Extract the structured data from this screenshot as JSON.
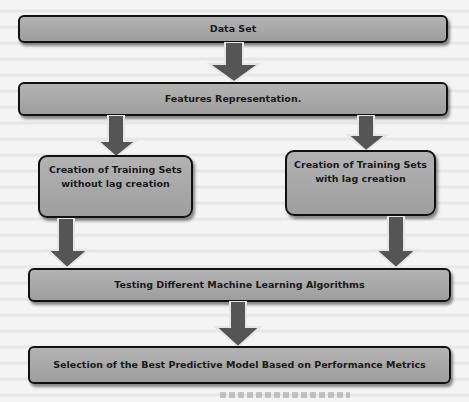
{
  "diagram": {
    "type": "flowchart",
    "colors": {
      "box_fill": "#a8a8a8",
      "box_border": "#111111",
      "arrow_fill": "#555555",
      "arrow_outline": "#e8e8e8",
      "background": "#f4f4f4"
    },
    "nodes": [
      {
        "id": "data_set",
        "label": "Data Set"
      },
      {
        "id": "features",
        "label": "Features Representation."
      },
      {
        "id": "train_no_lag",
        "label_line1": "Creation of Training Sets",
        "label_line2": "without lag creation"
      },
      {
        "id": "train_lag",
        "label_line1": "Creation of Training Sets",
        "label_line2": "with lag creation"
      },
      {
        "id": "testing",
        "label": "Testing Different Machine Learning Algorithms"
      },
      {
        "id": "selection",
        "label": "Selection of the Best Predictive Model Based on Performance Metrics"
      }
    ],
    "edges": [
      {
        "from": "data_set",
        "to": "features"
      },
      {
        "from": "features",
        "to": "train_no_lag"
      },
      {
        "from": "features",
        "to": "train_lag"
      },
      {
        "from": "train_no_lag",
        "to": "testing"
      },
      {
        "from": "train_lag",
        "to": "testing"
      },
      {
        "from": "testing",
        "to": "selection"
      }
    ]
  }
}
